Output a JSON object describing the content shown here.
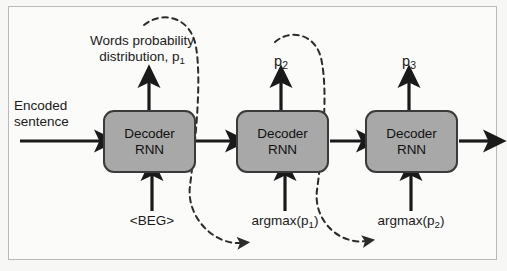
{
  "diagram": {
    "frame": {
      "border_color": "#b9b9b9",
      "background": "#fbfbf9"
    },
    "colors": {
      "box_fill": "#a8a8a8",
      "box_border": "#3a3a3a",
      "arrow": "#1a1a1a",
      "dashed": "#2b2b2b",
      "text": "#1a1a1a"
    },
    "blocks": [
      {
        "id": "decoder-1",
        "line1": "Decoder",
        "line2": "RNN"
      },
      {
        "id": "decoder-2",
        "line1": "Decoder",
        "line2": "RNN"
      },
      {
        "id": "decoder-3",
        "line1": "Decoder",
        "line2": "RNN"
      }
    ],
    "labels": {
      "input_line1": "Encoded",
      "input_line2": "sentence",
      "output1_line1": "Words probability",
      "output1_line2_pre": "distribution, p",
      "output1_line2_sub": "1",
      "output2_pre": "p",
      "output2_sub": "2",
      "output3_pre": "p",
      "output3_sub": "3",
      "bottom1": "<BEG>",
      "bottom2_pre": "argmax(p",
      "bottom2_sub": "1",
      "bottom2_post": ")",
      "bottom3_pre": "argmax(p",
      "bottom3_sub": "2",
      "bottom3_post": ")"
    },
    "arrows": [
      {
        "name": "encoded-sentence-into-decoder-1",
        "type": "solid",
        "direction": "right"
      },
      {
        "name": "decoder-1-to-decoder-2",
        "type": "solid",
        "direction": "right"
      },
      {
        "name": "decoder-2-to-decoder-3",
        "type": "solid",
        "direction": "right"
      },
      {
        "name": "decoder-3-output",
        "type": "solid",
        "direction": "right"
      },
      {
        "name": "beg-token-into-decoder-1",
        "type": "solid",
        "direction": "up"
      },
      {
        "name": "argmax-p1-into-decoder-2",
        "type": "solid",
        "direction": "up"
      },
      {
        "name": "argmax-p2-into-decoder-3",
        "type": "solid",
        "direction": "up"
      },
      {
        "name": "decoder-1-emits-p1",
        "type": "solid",
        "direction": "up"
      },
      {
        "name": "decoder-2-emits-p2",
        "type": "solid",
        "direction": "up"
      },
      {
        "name": "decoder-3-emits-p3",
        "type": "solid",
        "direction": "up"
      },
      {
        "name": "feedback-p1-to-argmax-p1",
        "type": "dashed",
        "direction": "curve"
      },
      {
        "name": "feedback-p2-to-argmax-p2",
        "type": "dashed",
        "direction": "curve"
      }
    ]
  }
}
